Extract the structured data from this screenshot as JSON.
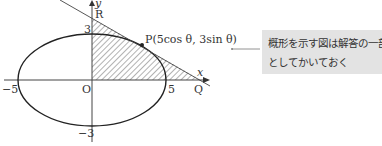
{
  "figure": {
    "labels": {
      "y_axis": "y",
      "x_axis": "x",
      "origin": "O",
      "R": "R",
      "Q": "Q",
      "P": "P(5cos θ, 3sin θ)",
      "x_pos": "5",
      "x_neg": "−5",
      "y_pos": "3",
      "y_neg": "−3"
    },
    "ellipse": {
      "a": 5,
      "b": 3
    },
    "colors": {
      "stroke": "#222222",
      "hatch": "#555555",
      "callout_bg": "#e3e3e3"
    }
  },
  "callout": {
    "line1": "概形を示す図は解答の一部",
    "line2": "としてかいておく"
  }
}
